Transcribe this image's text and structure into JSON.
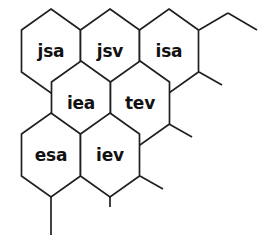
{
  "diagram": {
    "type": "hexagonal-grid",
    "background_color": "#ffffff",
    "line_color": "#231f20",
    "label_color": "#121212",
    "cells": [
      {
        "id": "cell-jsa",
        "label": "jsa",
        "row": 1,
        "col": 1,
        "cx": 51,
        "cy": 51
      },
      {
        "id": "cell-jsv",
        "label": "jsv",
        "row": 1,
        "col": 2,
        "cx": 110,
        "cy": 51
      },
      {
        "id": "cell-isa",
        "label": "isa",
        "row": 1,
        "col": 3,
        "cx": 169,
        "cy": 51
      },
      {
        "id": "cell-iea",
        "label": "iea",
        "row": 2,
        "col": 1,
        "cx": 81,
        "cy": 103
      },
      {
        "id": "cell-tev",
        "label": "tev",
        "row": 2,
        "col": 2,
        "cx": 140,
        "cy": 103
      },
      {
        "id": "cell-esa",
        "label": "esa",
        "row": 3,
        "col": 1,
        "cx": 51,
        "cy": 155
      },
      {
        "id": "cell-iev",
        "label": "iev",
        "row": 3,
        "col": 2,
        "cx": 110,
        "cy": 155
      }
    ],
    "stubs": [
      {
        "id": "stub-top-right-diagonal",
        "x1": 199,
        "y1": 30,
        "x2": 228,
        "y2": 13
      },
      {
        "id": "stub-top-right-horizontal",
        "x1": 228,
        "y1": 13,
        "x2": 257,
        "y2": 30
      },
      {
        "id": "stub-right-upper",
        "x1": 199,
        "y1": 72,
        "x2": 222,
        "y2": 85
      },
      {
        "id": "stub-right-middle",
        "x1": 169,
        "y1": 124,
        "x2": 192,
        "y2": 137
      },
      {
        "id": "stub-right-lower",
        "x1": 140,
        "y1": 176,
        "x2": 163,
        "y2": 189
      },
      {
        "id": "stub-bottom-left",
        "x1": 51,
        "y1": 197,
        "x2": 51,
        "y2": 235
      },
      {
        "id": "stub-bottom-middle",
        "x1": 110,
        "y1": 197,
        "x2": 110,
        "y2": 207
      }
    ]
  }
}
